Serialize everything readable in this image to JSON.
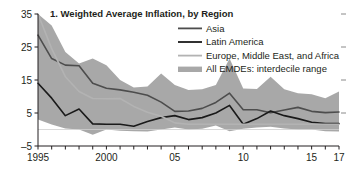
{
  "chart_data": {
    "type": "line",
    "title": "1. Weighted Average Inflation, by Region",
    "xlabel": "",
    "ylabel": "",
    "xlim": [
      1995,
      2017
    ],
    "ylim": [
      -5,
      35
    ],
    "yticks": [
      -5,
      5,
      15,
      25,
      35
    ],
    "ytick_labels": [
      "–5",
      "5",
      "15",
      "25",
      "35"
    ],
    "xticks": [
      1995,
      2000,
      2005,
      2010,
      2015,
      2017
    ],
    "xtick_labels": [
      "1995",
      "2000",
      "05",
      "10",
      "15",
      "17"
    ],
    "xtick_minor_step": 1,
    "grid": false,
    "legend_position": "top-right",
    "zero_line": 0,
    "right_axis_ticks": true,
    "x": [
      1995,
      1996,
      1997,
      1998,
      1999,
      2000,
      2001,
      2002,
      2003,
      2004,
      2005,
      2006,
      2007,
      2008,
      2009,
      2010,
      2011,
      2012,
      2013,
      2014,
      2015,
      2016,
      2017
    ],
    "series": [
      {
        "name": "Asia",
        "color": "#4d4d4d",
        "width": 1.6,
        "values": [
          28.6,
          21.5,
          19.5,
          19.3,
          14.0,
          12.5,
          12.0,
          11.3,
          10.4,
          8.3,
          5.5,
          5.6,
          6.4,
          8.2,
          11.0,
          6.0,
          6.0,
          5.1,
          5.9,
          6.7,
          5.5,
          5.1,
          5.3
        ]
      },
      {
        "name": "Latin America",
        "color": "#1a1a1a",
        "width": 1.6,
        "values": [
          14.0,
          9.5,
          4.2,
          6.2,
          1.7,
          1.6,
          1.6,
          1.0,
          2.4,
          3.6,
          4.2,
          3.0,
          3.6,
          5.0,
          7.3,
          1.6,
          3.3,
          5.6,
          4.2,
          3.3,
          2.2,
          1.8,
          1.8
        ]
      },
      {
        "name": "Europe, Middle East, and Africa",
        "color": "#b3b3b3",
        "width": 1.6,
        "values": [
          35.0,
          24.5,
          16.0,
          11.5,
          9.4,
          9.3,
          9.4,
          7.0,
          5.2,
          4.0,
          2.0,
          1.6,
          1.6,
          1.6,
          1.6,
          1.6,
          1.6,
          1.6,
          1.6,
          1.6,
          1.6,
          1.6,
          1.6
        ]
      }
    ],
    "band": {
      "name": "All EMDEs: interdecile range",
      "color": "#a8a8a8",
      "upper": [
        35.0,
        31.5,
        23.5,
        20.0,
        21.5,
        19.5,
        15.0,
        12.7,
        13.0,
        17.0,
        13.5,
        12.0,
        12.2,
        13.5,
        21.5,
        12.4,
        12.3,
        16.0,
        12.2,
        11.0,
        10.7,
        9.5,
        11.5
      ],
      "lower": [
        3.0,
        1.5,
        0.3,
        0.0,
        -1.6,
        0.0,
        -0.4,
        -0.5,
        -0.6,
        0.0,
        0.6,
        0.0,
        0.2,
        1.2,
        -0.5,
        0.2,
        0.6,
        0.8,
        0.3,
        0.0,
        0.0,
        -0.5,
        -0.6
      ]
    },
    "legend": [
      {
        "label": "Asia",
        "type": "line",
        "color": "#4d4d4d"
      },
      {
        "label": "Latin America",
        "type": "line",
        "color": "#1a1a1a"
      },
      {
        "label": "Europe, Middle East, and Africa",
        "type": "line",
        "color": "#b3b3b3"
      },
      {
        "label": "All EMDEs: interdecile range",
        "type": "band",
        "color": "#a8a8a8"
      }
    ]
  }
}
